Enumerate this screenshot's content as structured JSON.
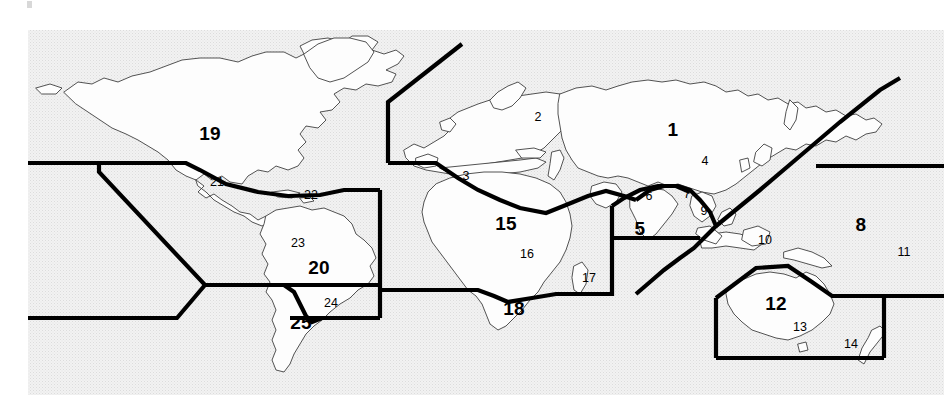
{
  "figure": {
    "kind": "world-map",
    "background_color": "#efefef",
    "land_fill_color": "#fdfdfd",
    "coastline_color": "#3a3a3a",
    "boundary_color": "#000000",
    "label_color": "#000000",
    "plot_area": {
      "x": 28,
      "y": 30,
      "width": 916,
      "height": 365
    }
  },
  "regions": [
    {
      "id": "1",
      "number": "1",
      "emphasis": "major",
      "x": 673,
      "y": 129,
      "area_name": "northern-asia"
    },
    {
      "id": "2",
      "number": "2",
      "emphasis": "minor",
      "x": 538,
      "y": 117,
      "area_name": "northern-europe"
    },
    {
      "id": "3",
      "number": "3",
      "emphasis": "minor",
      "x": 466,
      "y": 176,
      "area_name": "southern-europe"
    },
    {
      "id": "4",
      "number": "4",
      "emphasis": "minor",
      "x": 705,
      "y": 161,
      "area_name": "eastern-asia"
    },
    {
      "id": "5",
      "number": "5",
      "emphasis": "major",
      "x": 640,
      "y": 228,
      "area_name": "south-asia"
    },
    {
      "id": "6",
      "number": "6",
      "emphasis": "minor",
      "x": 649,
      "y": 196,
      "area_name": "himalaya-region"
    },
    {
      "id": "7",
      "number": "7",
      "emphasis": "minor",
      "x": 687,
      "y": 194,
      "area_name": "indochina"
    },
    {
      "id": "8",
      "number": "8",
      "emphasis": "major",
      "x": 861,
      "y": 224,
      "area_name": "pacific-ocean"
    },
    {
      "id": "9",
      "number": "9",
      "emphasis": "minor",
      "x": 704,
      "y": 211,
      "area_name": "philippines"
    },
    {
      "id": "10",
      "number": "10",
      "emphasis": "minor",
      "x": 765,
      "y": 240,
      "area_name": "new-guinea"
    },
    {
      "id": "11",
      "number": "11",
      "emphasis": "minor",
      "x": 904,
      "y": 252,
      "area_name": "oceania-pacific"
    },
    {
      "id": "12",
      "number": "12",
      "emphasis": "major",
      "x": 776,
      "y": 303,
      "area_name": "australia"
    },
    {
      "id": "13",
      "number": "13",
      "emphasis": "minor",
      "x": 800,
      "y": 327,
      "area_name": "southeast-australia"
    },
    {
      "id": "14",
      "number": "14",
      "emphasis": "minor",
      "x": 851,
      "y": 344,
      "area_name": "new-zealand"
    },
    {
      "id": "15",
      "number": "15",
      "emphasis": "major",
      "x": 506,
      "y": 223,
      "area_name": "west-africa"
    },
    {
      "id": "16",
      "number": "16",
      "emphasis": "minor",
      "x": 527,
      "y": 254,
      "area_name": "central-africa"
    },
    {
      "id": "17",
      "number": "17",
      "emphasis": "minor",
      "x": 589,
      "y": 278,
      "area_name": "madagascar"
    },
    {
      "id": "18",
      "number": "18",
      "emphasis": "major",
      "x": 514,
      "y": 308,
      "area_name": "southern-africa"
    },
    {
      "id": "19",
      "number": "19",
      "emphasis": "major",
      "x": 210,
      "y": 133,
      "area_name": "north-america"
    },
    {
      "id": "20",
      "number": "20",
      "emphasis": "major",
      "x": 319,
      "y": 267,
      "area_name": "brazil"
    },
    {
      "id": "21",
      "number": "21",
      "emphasis": "minor",
      "x": 217,
      "y": 182,
      "area_name": "mexico"
    },
    {
      "id": "22",
      "number": "22",
      "emphasis": "minor",
      "x": 311,
      "y": 195,
      "area_name": "caribbean"
    },
    {
      "id": "23",
      "number": "23",
      "emphasis": "minor",
      "x": 298,
      "y": 243,
      "area_name": "northern-south-america"
    },
    {
      "id": "24",
      "number": "24",
      "emphasis": "minor",
      "x": 331,
      "y": 303,
      "area_name": "southeast-brazil"
    },
    {
      "id": "25",
      "number": "25",
      "emphasis": "major",
      "x": 301,
      "y": 322,
      "area_name": "southern-cone"
    }
  ]
}
